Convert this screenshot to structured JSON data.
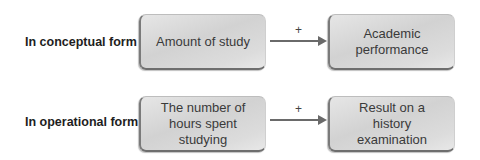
{
  "rows": [
    {
      "label": "In conceptual form",
      "cause": "Amount of study",
      "relation": "+",
      "effect": "Academic performance"
    },
    {
      "label": "In operational form",
      "cause": "The number of hours spent studying",
      "relation": "+",
      "effect": "Result on a history examination"
    }
  ],
  "colors": {
    "box_fill": "#d8d8d8",
    "box_edge": "#707070",
    "arrow": "#6a6a6a",
    "label_text": "#1e1e1e",
    "box_text": "#3a3a3a"
  }
}
